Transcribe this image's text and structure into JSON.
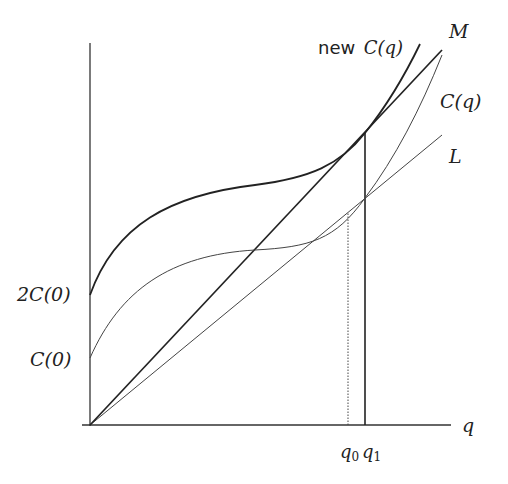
{
  "diagram": {
    "type": "cost-curves",
    "axes": {
      "x_label": "q",
      "y_intercepts": [
        "2C(0)",
        "C(0)"
      ]
    },
    "curves": {
      "new_cost": {
        "label_prefix": "new",
        "label": "C(q)"
      },
      "cost": {
        "label": "C(q)"
      },
      "line_M": {
        "label": "M"
      },
      "line_L": {
        "label": "L"
      }
    },
    "markers": {
      "q0": {
        "base": "q",
        "sub": "0",
        "style": "dotted"
      },
      "q1": {
        "base": "q",
        "sub": "1",
        "style": "solid"
      }
    },
    "colors": {
      "line": "#2a2a2a",
      "thin_line": "#555555",
      "background": "#ffffff"
    }
  }
}
